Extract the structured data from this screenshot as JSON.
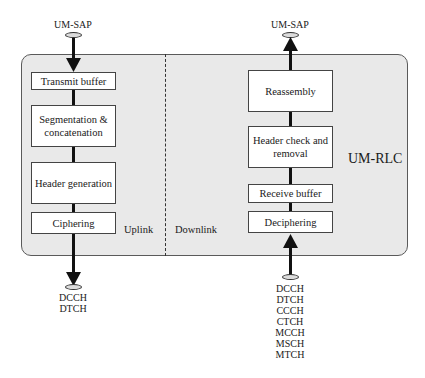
{
  "diagram": {
    "title": "UM-RLC",
    "uplink": {
      "label": "Uplink",
      "top_sap": "UM-SAP",
      "boxes": [
        {
          "label": "Transmit buffer"
        },
        {
          "label": "Segmentation & concatenation"
        },
        {
          "label": "Header generation"
        },
        {
          "label": "Ciphering"
        }
      ],
      "bottom_channels": "DCCH\nDTCH"
    },
    "downlink": {
      "label": "Downlink",
      "top_sap": "UM-SAP",
      "boxes": [
        {
          "label": "Reassembly"
        },
        {
          "label": "Header check and removal"
        },
        {
          "label": "Receive buffer"
        },
        {
          "label": "Deciphering"
        }
      ],
      "bottom_channels": "DCCH\nDTCH\nCCCH\nCTCH\nMCCH\nMSCH\nMTCH"
    },
    "colors": {
      "panel": "#e9e9e9",
      "box": "#ffffff",
      "line": "#111111"
    }
  }
}
